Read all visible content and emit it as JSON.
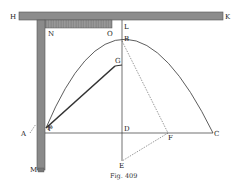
{
  "figure": {
    "caption": "Fig. 409",
    "labels": {
      "H": "H",
      "K": "K",
      "N": "N",
      "O": "O",
      "L": "L",
      "B": "B",
      "G": "G",
      "F1": "F",
      "A": "A",
      "P": "P",
      "D": "D",
      "F2": "F",
      "C": "C",
      "E": "E",
      "M": "M"
    },
    "colors": {
      "bar_fill": "#8a8a8a",
      "bar_stroke": "#444444",
      "line": "#333333",
      "background": "#ffffff"
    }
  }
}
